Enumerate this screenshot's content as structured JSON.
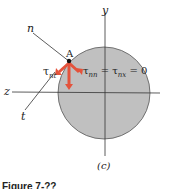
{
  "figure": {
    "axis_labels": {
      "y": "y",
      "z": "z",
      "n": "n",
      "t": "t"
    },
    "point_label": "A",
    "stress_left": "τ",
    "stress_left_sub": "nt",
    "stress_right": "τ",
    "stress_right_sub1": "nn",
    "stress_right_eq1": " = τ",
    "stress_right_sub2": "nx",
    "stress_right_eq2": " = 0",
    "subfigure": "(c)",
    "caption": "Figure 7-??"
  },
  "colors": {
    "circle_fill": "#c0c0c0",
    "arrow": "#e4533c",
    "line": "#333333"
  }
}
